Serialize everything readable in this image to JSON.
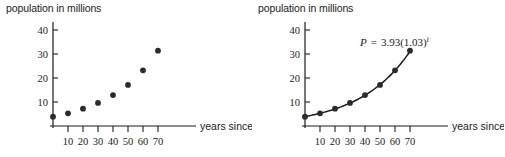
{
  "figure": {
    "background": "#ffffff",
    "ink_color": "#1c1c1c",
    "point_color": "#2b2b2b"
  },
  "panels": [
    {
      "id": "left",
      "axis_title": "population in millions",
      "xlabel": "years since 1790",
      "show_curve": false,
      "equation": null
    },
    {
      "id": "right",
      "axis_title": "population in millions",
      "xlabel": "years since 1790",
      "show_curve": true,
      "equation": {
        "lhs": "P",
        "eq": "=",
        "coefficient": "3.93",
        "base": "(1.03)",
        "exponent": "t",
        "full": "P = 3.93(1.03)^t"
      }
    }
  ],
  "chart_data": [
    {
      "type": "scatter",
      "title": "population in millions",
      "xlabel": "years since 1790",
      "ylabel": "population in millions",
      "x": [
        0,
        10,
        20,
        30,
        40,
        50,
        60,
        70
      ],
      "values": [
        3.9,
        5.3,
        7.2,
        9.6,
        12.9,
        17.1,
        23.2,
        31.4
      ],
      "xticks": [
        10,
        20,
        30,
        40,
        50,
        60,
        70
      ],
      "yticks": [
        10,
        20,
        30,
        40
      ],
      "xlim": [
        0,
        78
      ],
      "ylim": [
        0,
        44
      ],
      "grid": false,
      "legend": "none"
    },
    {
      "type": "line",
      "title": "population in millions",
      "xlabel": "years since 1790",
      "ylabel": "population in millions",
      "x": [
        0,
        10,
        20,
        30,
        40,
        50,
        60,
        70
      ],
      "values": [
        3.9,
        5.3,
        7.2,
        9.6,
        12.9,
        17.1,
        23.2,
        31.4
      ],
      "xticks": [
        10,
        20,
        30,
        40,
        50,
        60,
        70
      ],
      "yticks": [
        10,
        20,
        30,
        40
      ],
      "xlim": [
        0,
        78
      ],
      "ylim": [
        0,
        44
      ],
      "grid": false,
      "legend": "none",
      "annotations": [
        {
          "text": "P = 3.93(1.03)^t",
          "x": 40,
          "y": 36
        }
      ],
      "fit": {
        "model": "exponential",
        "a": 3.93,
        "b": 1.03,
        "expression": "P = 3.93(1.03)^t"
      }
    }
  ]
}
